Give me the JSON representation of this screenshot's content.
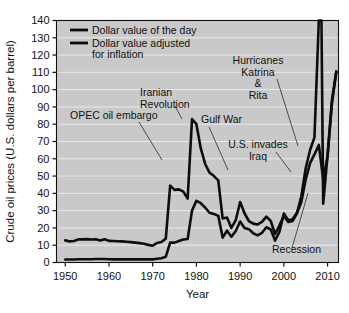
{
  "figure": {
    "name": "crude-oil-prices-chart",
    "background_color": "#ffffff",
    "plot_background_color": "#c9c9c9",
    "line_color": "#0d0d0d",
    "gridline_color": "#e9e9e9"
  },
  "chart_data": {
    "type": "line",
    "title": "",
    "xlabel": "Year",
    "ylabel": "Crude oil prices (U.S. dollars per barrel)",
    "xlim": [
      1948,
      2012.5
    ],
    "ylim": [
      0,
      140
    ],
    "xticks": [
      1950,
      1960,
      1970,
      1980,
      1990,
      2000,
      2010
    ],
    "xtick_labels": [
      "1950",
      "1960",
      "1970",
      "1980",
      "1990",
      "2000",
      "2010"
    ],
    "yticks": [
      0,
      10,
      20,
      30,
      40,
      50,
      60,
      70,
      80,
      90,
      100,
      110,
      120,
      130,
      140
    ],
    "ytick_labels": [
      "0",
      "10",
      "20",
      "30",
      "40",
      "50",
      "60",
      "70",
      "80",
      "90",
      "100",
      "110",
      "120",
      "130",
      "140"
    ],
    "grid": true,
    "grid_axis": "y",
    "legend_position": "top-left",
    "series": [
      {
        "name": "Dollar value of the day",
        "legend_label": "Dollar value of the day",
        "color": "#0d0d0d",
        "x": [
          1950,
          1951,
          1952,
          1953,
          1954,
          1955,
          1956,
          1957,
          1958,
          1959,
          1960,
          1961,
          1962,
          1963,
          1964,
          1965,
          1966,
          1967,
          1968,
          1969,
          1970,
          1971,
          1972,
          1973,
          1974,
          1975,
          1976,
          1977,
          1978,
          1979,
          1980,
          1981,
          1982,
          1983,
          1984,
          1985,
          1986,
          1987,
          1988,
          1989,
          1990,
          1991,
          1992,
          1993,
          1994,
          1995,
          1996,
          1997,
          1998,
          1999,
          2000,
          2001,
          2002,
          2003,
          2004,
          2005,
          2006,
          2007,
          2008,
          2008.6,
          2009,
          2010,
          2011,
          2012
        ],
        "values": [
          1.7,
          1.7,
          1.7,
          1.9,
          1.9,
          1.9,
          1.9,
          2.0,
          2.0,
          2.0,
          1.9,
          1.8,
          1.8,
          1.8,
          1.8,
          1.8,
          1.8,
          1.8,
          1.8,
          1.8,
          1.8,
          2.2,
          2.5,
          3.3,
          11.6,
          11.5,
          12.4,
          13.3,
          13.6,
          30.0,
          35.7,
          34.3,
          31.8,
          28.8,
          28.1,
          27.0,
          14.4,
          18.4,
          14.9,
          18.2,
          23.7,
          20.0,
          19.3,
          16.9,
          15.7,
          17.2,
          20.4,
          19.1,
          12.7,
          17.9,
          28.3,
          24.4,
          25.0,
          28.8,
          38.3,
          54.5,
          65.1,
          72.4,
          140.0,
          140.0,
          34.0,
          62.0,
          94.0,
          110.5
        ]
      },
      {
        "name": "Dollar value adjusted for inflation",
        "legend_label": "Dollar value adjusted for inflation",
        "color": "#0d0d0d",
        "x": [
          1950,
          1951,
          1952,
          1953,
          1954,
          1955,
          1956,
          1957,
          1958,
          1959,
          1960,
          1961,
          1962,
          1963,
          1964,
          1965,
          1966,
          1967,
          1968,
          1969,
          1970,
          1971,
          1972,
          1973,
          1974,
          1975,
          1976,
          1977,
          1978,
          1979,
          1980,
          1981,
          1982,
          1983,
          1984,
          1985,
          1986,
          1987,
          1988,
          1989,
          1990,
          1991,
          1992,
          1993,
          1994,
          1995,
          1996,
          1997,
          1998,
          1999,
          2000,
          2001,
          2002,
          2003,
          2004,
          2005,
          2006,
          2007,
          2008,
          2009,
          2010,
          2011,
          2012
        ],
        "values": [
          12.8,
          12.2,
          12.4,
          13.4,
          13.4,
          13.5,
          13.3,
          13.4,
          12.7,
          13.4,
          12.5,
          12.4,
          12.3,
          12.2,
          12.0,
          11.8,
          11.5,
          11.2,
          10.8,
          10.2,
          9.7,
          11.3,
          11.9,
          13.8,
          44.5,
          42.0,
          42.3,
          41.0,
          37.0,
          83.0,
          80.0,
          66.0,
          57.0,
          52.0,
          50.0,
          47.5,
          25.5,
          26.0,
          20.0,
          24.5,
          35.0,
          28.5,
          24.0,
          22.5,
          22.0,
          23.5,
          26.5,
          24.0,
          16.5,
          21.5,
          27.0,
          23.5,
          24.0,
          28.5,
          35.0,
          48.0,
          57.5,
          62.5,
          68.0,
          48.0,
          61.5,
          92.0,
          110.5
        ]
      }
    ],
    "annotations": [
      {
        "label": "OPEC oil embargo",
        "lines": [
          "OPEC oil embargo"
        ],
        "points_to_year": 1973,
        "points_to_value": 44
      },
      {
        "label": "Iranian Revolution",
        "lines": [
          "Iranian",
          "Revolution"
        ],
        "points_to_year": 1979,
        "points_to_value": 83
      },
      {
        "label": "Gulf War",
        "lines": [
          "Gulf War"
        ],
        "points_to_year": 1990,
        "points_to_value": 35
      },
      {
        "label": "Hurricanes Katrina & Rita",
        "lines": [
          "Hurricanes",
          "Katrina",
          "&",
          "Rita"
        ],
        "points_to_year": 2005,
        "points_to_value": 54
      },
      {
        "label": "U.S. invades Iraq",
        "lines": [
          "U.S. invades",
          "Iraq"
        ],
        "points_to_year": 2003,
        "points_to_value": 29
      },
      {
        "label": "Recession",
        "lines": [
          "Recession"
        ],
        "points_to_year": 2009,
        "points_to_value": 34
      }
    ]
  }
}
